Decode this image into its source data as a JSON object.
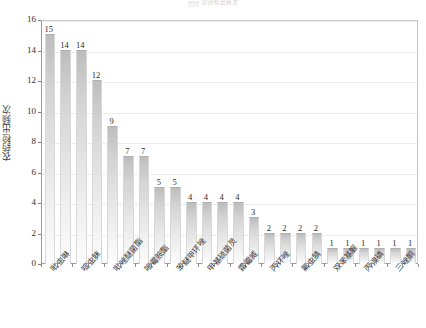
{
  "legend": {
    "label": "农药检出频次",
    "swatch_color": "#cfcfcf"
  },
  "axes": {
    "y_title": "农药检出频次",
    "y_ticks": [
      "0",
      "2",
      "4",
      "6",
      "8",
      "10",
      "12",
      "14",
      "16"
    ]
  },
  "chart_data": {
    "type": "bar",
    "title": "",
    "subtitle": "",
    "xlabel": "",
    "ylabel": "农药检出频次",
    "ylim": [
      0,
      16
    ],
    "ytick_step": 2,
    "grid": true,
    "legend_position": "top-center",
    "legend_entries": [
      "农药检出频次"
    ],
    "bar_color": "#d0d0d0",
    "bar_gradient": [
      "#bdbdbd",
      "#fdfdfd"
    ],
    "categories": [
      "吡虫啉",
      "啶虫脒",
      "毒死蜱",
      "多菌灵",
      "吡唑醚菌酯",
      "噻虫嗪",
      "烯酰吗啉",
      "腐霉利",
      "苯醚甲环唑",
      "嘧菌酯",
      "甲基硫菌灵",
      "氯氰菊酯",
      "霜霉威",
      "克百威",
      "丙环唑",
      "灭幼脲",
      "氟虫腈",
      "哒螨灵",
      "双苯基脲",
      "联苯菊酯",
      "丙溴磷",
      "辛硫磷",
      "氟硅唑",
      "三唑酮"
    ],
    "values": [
      15,
      14,
      14,
      12,
      9,
      7,
      7,
      5,
      5,
      4,
      4,
      4,
      4,
      3,
      2,
      2,
      2,
      2,
      1,
      1,
      1,
      1,
      1,
      1
    ],
    "data_labels": [
      "15",
      "14",
      "14",
      "12",
      "9",
      "7",
      "7",
      "5",
      "5",
      "4",
      "4",
      "4",
      "4",
      "3",
      "2",
      "2",
      "2",
      "2",
      "1",
      "1",
      "1",
      "1",
      "1",
      "1"
    ],
    "visible_xtick_labels": [
      {
        "index": 0,
        "text": "吡虫啉"
      },
      {
        "index": 2,
        "text": "啶虫脒"
      },
      {
        "index": 4,
        "text": "吡唑醚菌酯"
      },
      {
        "index": 6,
        "text": "嘧霉胺酯"
      },
      {
        "index": 8,
        "text": "苯醚甲环唑"
      },
      {
        "index": 10,
        "text": "甲基硫菌灵"
      },
      {
        "index": 12,
        "text": "霜霉威"
      },
      {
        "index": 14,
        "text": "丙环唑"
      },
      {
        "index": 16,
        "text": "氟虫腈"
      },
      {
        "index": 18,
        "text": "双苯基脲"
      },
      {
        "index": 20,
        "text": "丙溴磷"
      },
      {
        "index": 22,
        "text": "三唑酮"
      }
    ]
  }
}
